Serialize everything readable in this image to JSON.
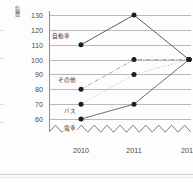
{
  "chart_data": {
    "type": "line",
    "title": "",
    "xlabel": "年",
    "ylabel": "指数",
    "x": [
      "2010",
      "2011",
      "2012"
    ],
    "categories": [
      "2010",
      "2011",
      "2012"
    ],
    "ylim": [
      55,
      135
    ],
    "yticks": [
      130,
      120,
      110,
      100,
      90,
      80,
      70,
      60
    ],
    "ytick_labels": [
      "130",
      "120",
      "110",
      "100",
      "90",
      "80",
      "70",
      "60"
    ],
    "grid": true,
    "legend": "inline-labels-at-first-point",
    "axis_break": "zigzag below 60",
    "series": [
      {
        "name": "自動車",
        "values": [
          110,
          130,
          100
        ],
        "line_style": "solid",
        "color": "#555555"
      },
      {
        "name": "その他",
        "values": [
          80,
          100,
          100
        ],
        "line_style": "dashdot",
        "color": "#8a8a8a"
      },
      {
        "name": "バス",
        "values": [
          70,
          90,
          100
        ],
        "line_style": "dotted",
        "color": "#9a9a9a"
      },
      {
        "name": "電車",
        "values": [
          60,
          70,
          100
        ],
        "line_style": "solid",
        "color": "#666666"
      }
    ],
    "marker": "filled-circle",
    "marker_color": "#1d1d1d"
  },
  "axes": {
    "y_title": "指数",
    "x_unit": "年"
  }
}
